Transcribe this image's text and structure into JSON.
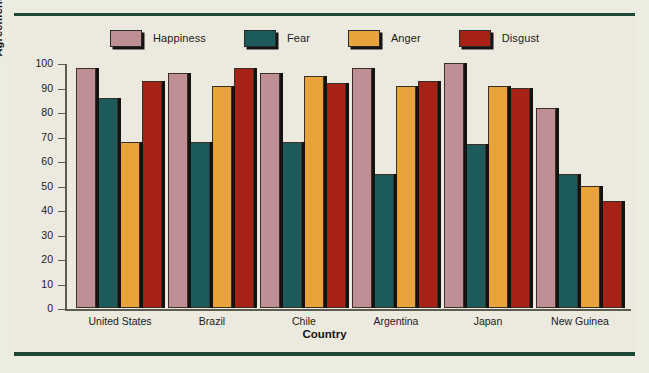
{
  "figure": {
    "background_color": "#edece0",
    "rule_color": "#1d4a38"
  },
  "chart_data": {
    "type": "bar",
    "title": "",
    "xlabel": "Country",
    "ylabel": "Agreement in judging photos (%)",
    "categories": [
      "United States",
      "Brazil",
      "Chile",
      "Argentina",
      "Japan",
      "New Guinea"
    ],
    "series": [
      {
        "name": "Happiness",
        "color": "#bf8f96",
        "values": [
          97,
          95,
          95,
          97,
          99,
          81
        ]
      },
      {
        "name": "Fear",
        "color": "#1d5a5a",
        "values": [
          85,
          67,
          67,
          54,
          66,
          54
        ]
      },
      {
        "name": "Anger",
        "color": "#e8a33d",
        "values": [
          67,
          90,
          94,
          90,
          90,
          49
        ]
      },
      {
        "name": "Disgust",
        "color": "#a72216",
        "values": [
          92,
          97,
          91,
          92,
          89,
          43
        ]
      }
    ],
    "ylim": [
      0,
      100
    ],
    "yticks": [
      0,
      10,
      20,
      30,
      40,
      50,
      60,
      70,
      80,
      90,
      100
    ],
    "ytick_labels": [
      "0",
      "10",
      "20",
      "30",
      "40",
      "50",
      "60",
      "70",
      "80",
      "90",
      "100"
    ],
    "grid": false,
    "legend_position": "top"
  }
}
